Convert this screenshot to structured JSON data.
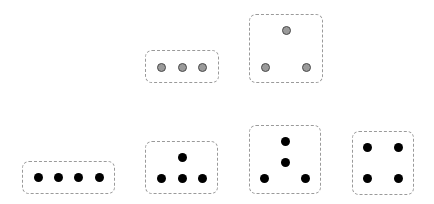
{
  "diagram": {
    "colors": {
      "box_border": "#9a9a9a",
      "gray_dot_fill": "#9a9a9a",
      "gray_dot_stroke": "#4a4a4a",
      "black_dot_fill": "#000000"
    },
    "top_row": [
      {
        "id": "top-1",
        "box": {
          "x": 145,
          "y": 50,
          "w": 74,
          "h": 33
        },
        "dot_style": "gray",
        "dot_size": 9,
        "dots": [
          [
            161,
            67
          ],
          [
            182,
            67
          ],
          [
            202,
            67
          ]
        ]
      },
      {
        "id": "top-2",
        "box": {
          "x": 249,
          "y": 14,
          "w": 74,
          "h": 69
        },
        "dot_style": "gray",
        "dot_size": 9,
        "dots": [
          [
            286,
            30
          ],
          [
            265,
            67
          ],
          [
            306,
            67
          ]
        ]
      }
    ],
    "bottom_row": [
      {
        "id": "bottom-1",
        "box": {
          "x": 22,
          "y": 161,
          "w": 93,
          "h": 33
        },
        "dot_style": "black",
        "dot_size": 9,
        "dots": [
          [
            38,
            177
          ],
          [
            58,
            177
          ],
          [
            78,
            177
          ],
          [
            99,
            177
          ]
        ]
      },
      {
        "id": "bottom-2",
        "box": {
          "x": 145,
          "y": 141,
          "w": 73,
          "h": 53
        },
        "dot_style": "black",
        "dot_size": 9,
        "dots": [
          [
            182,
            157
          ],
          [
            161,
            178
          ],
          [
            182,
            178
          ],
          [
            202,
            178
          ]
        ]
      },
      {
        "id": "bottom-3",
        "box": {
          "x": 249,
          "y": 125,
          "w": 72,
          "h": 69
        },
        "dot_style": "black",
        "dot_size": 9,
        "dots": [
          [
            285,
            141
          ],
          [
            285,
            162
          ],
          [
            264,
            178
          ],
          [
            305,
            178
          ]
        ]
      },
      {
        "id": "bottom-4",
        "box": {
          "x": 352,
          "y": 131,
          "w": 62,
          "h": 64
        },
        "dot_style": "black",
        "dot_size": 9,
        "dots": [
          [
            367,
            147
          ],
          [
            398,
            147
          ],
          [
            367,
            178
          ],
          [
            398,
            178
          ]
        ]
      }
    ]
  }
}
